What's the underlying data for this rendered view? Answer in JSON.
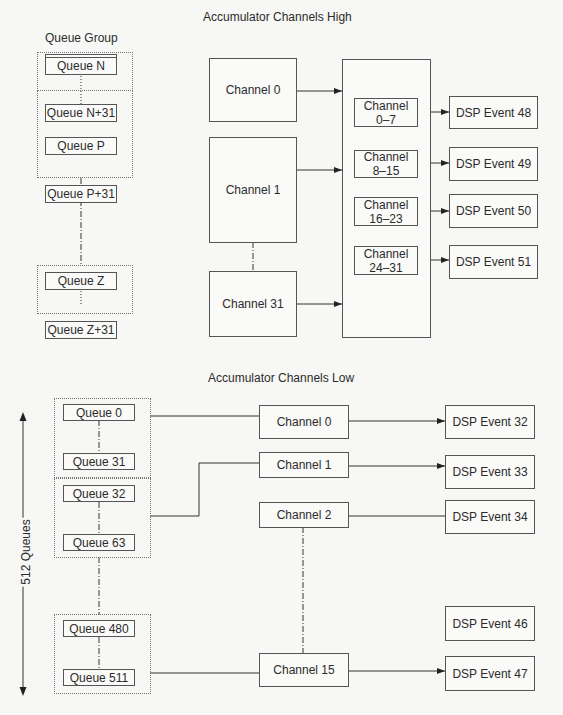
{
  "high": {
    "title": "Accumulator Channels High",
    "queue_group_label": "Queue Group",
    "queue_groups": [
      {
        "top": "Queue N",
        "bottom": "Queue N+31"
      },
      {
        "top": "Queue P",
        "bottom": "Queue P+31"
      },
      {
        "top": "Queue Z",
        "bottom": "Queue Z+31"
      }
    ],
    "channels": [
      "Channel 0",
      "Channel 1",
      "Channel 31"
    ],
    "channel_ranges": [
      "Channel\n0–7",
      "Channel\n8–15",
      "Channel\n16–23",
      "Channel\n24–31"
    ],
    "dsp_events": [
      "DSP Event 48",
      "DSP Event 49",
      "DSP Event 50",
      "DSP Event 51"
    ]
  },
  "low": {
    "title": "Accumulator Channels Low",
    "queue_groups": [
      {
        "top": "Queue 0",
        "bottom": "Queue 31"
      },
      {
        "top": "Queue 32",
        "bottom": "Queue 63"
      },
      {
        "top": "Queue 480",
        "bottom": "Queue 511"
      }
    ],
    "channels": [
      "Channel 0",
      "Channel 1",
      "Channel 2",
      "Channel 15"
    ],
    "dsp_events": [
      "DSP Event 32",
      "DSP Event 33",
      "DSP Event 34",
      "DSP Event 46",
      "DSP Event 47"
    ],
    "range_label": "512 Queues"
  }
}
